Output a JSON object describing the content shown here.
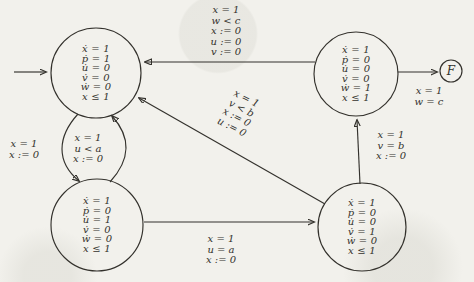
{
  "figure": {
    "final_state_label": "F"
  },
  "states": {
    "top_left": {
      "lines": [
        "ẋ = 1",
        "ṗ = 1",
        "u̇ = 0",
        "v̇ = 0",
        "ẇ = 0",
        "x ≤ 1"
      ]
    },
    "top_right": {
      "lines": [
        "ẋ = 1",
        "ṗ = 0",
        "u̇ = 0",
        "v̇ = 0",
        "ẇ = 1",
        "x ≤ 1"
      ]
    },
    "bottom_left": {
      "lines": [
        "ẋ = 1",
        "ṗ = 0",
        "u̇ = 1",
        "v̇ = 0",
        "ẇ = 0",
        "x ≤ 1"
      ]
    },
    "bottom_right": {
      "lines": [
        "ẋ = 1",
        "ṗ = 0",
        "u̇ = 0",
        "v̇ = 1",
        "ẇ = 0",
        "x ≤ 1"
      ]
    }
  },
  "edges": {
    "top_right_to_top_left": {
      "lines": [
        "x = 1",
        "w < c",
        "x := 0",
        "u := 0",
        "v := 0"
      ]
    },
    "top_left_to_bottom_left": {
      "lines": [
        "x = 1",
        "x := 0"
      ]
    },
    "bottom_left_to_top_left": {
      "lines": [
        "x = 1",
        "u < a",
        "x := 0"
      ]
    },
    "bottom_left_to_bottom_right": {
      "lines": [
        "x = 1",
        "u = a",
        "x := 0"
      ]
    },
    "bottom_right_to_top_left": {
      "lines": [
        "x = 1",
        "v < b",
        "x := 0",
        "u := 0"
      ]
    },
    "bottom_right_to_top_right": {
      "lines": [
        "x = 1",
        "v = b",
        "x := 0"
      ]
    },
    "top_right_to_final": {
      "lines": [
        "x = 1",
        "w = c"
      ]
    }
  },
  "colors": {
    "ink": "#33312c",
    "paper": "#f2f1ec"
  }
}
